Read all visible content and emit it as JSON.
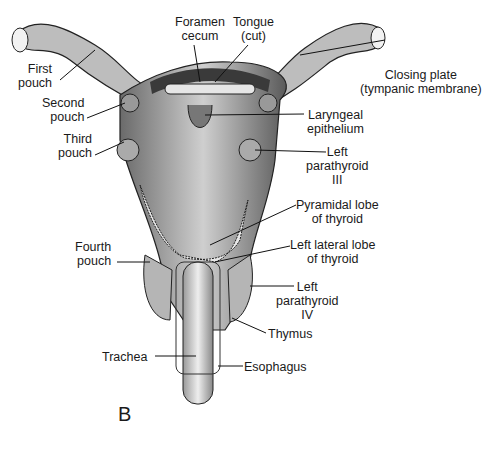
{
  "figure": {
    "panel_letter": "B",
    "labels": {
      "foramen_cecum": [
        "Foramen",
        "cecum"
      ],
      "tongue": [
        "Tongue",
        "(cut)"
      ],
      "first_pouch": [
        "First",
        "pouch"
      ],
      "closing_plate": [
        "Closing plate",
        "(tympanic membrane)"
      ],
      "second_pouch": [
        "Second",
        "pouch"
      ],
      "laryngeal": [
        "Laryngeal",
        "epithelium"
      ],
      "third_pouch": [
        "Third",
        "pouch"
      ],
      "left_parathyroid_3": [
        "Left",
        "parathyroid",
        "III"
      ],
      "pyramidal_lobe": [
        "Pyramidal lobe",
        "of thyroid"
      ],
      "left_lateral_lobe": [
        "Left lateral lobe",
        "of thyroid"
      ],
      "fourth_pouch": [
        "Fourth",
        "pouch"
      ],
      "left_parathyroid_4": [
        "Left",
        "parathyroid",
        "IV"
      ],
      "thymus": [
        "Thymus"
      ],
      "trachea": [
        "Trachea"
      ],
      "esophagus": [
        "Esophagus"
      ]
    }
  }
}
